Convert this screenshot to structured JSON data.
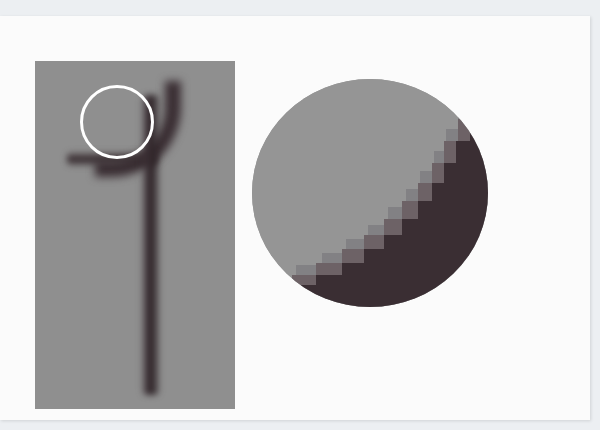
{
  "figure": {
    "colors": {
      "background_page": "#fbfbfb",
      "panel_gray": "#8f8f8f",
      "stroke_dark": "#33282c",
      "highlight_ring": "#ffffff",
      "zoom_background": "#959595"
    }
  }
}
